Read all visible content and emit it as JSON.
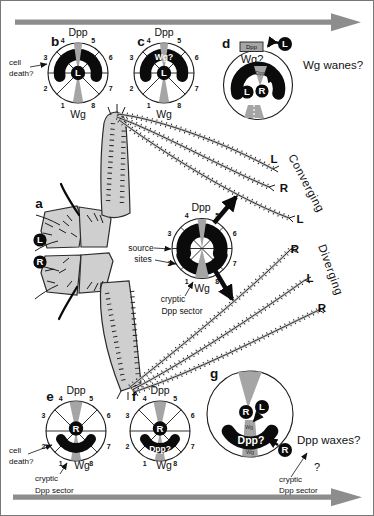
{
  "colors": {
    "big_arrow_gray": "#8d8d8d",
    "wedge_gray": "#a5a5a5",
    "source_arc_black": "#0b0b0b",
    "leg_fill_gray": "#cfcfcf",
    "background": "#ffffff"
  },
  "figure": {
    "sector_numbers": [
      "1",
      "2",
      "3",
      "4",
      "5",
      "6",
      "7",
      "8"
    ],
    "panel_a": {
      "label": "a",
      "left_badge": "L",
      "right_badge": "R"
    },
    "panel_b": {
      "label": "b",
      "dpp": "Dpp",
      "wg": "Wg",
      "center_badge": "L",
      "cell_death_line1": "cell",
      "cell_death_line2": "death?"
    },
    "panel_c": {
      "label": "c",
      "dpp": "Dpp",
      "wg": "Wg",
      "center_badge": "L",
      "wg_question": "Wg?"
    },
    "panel_d": {
      "label": "d",
      "dpp_box": "Dpp",
      "wg_question": "Wg?",
      "dpp_wedge": "Dpp",
      "left_badge": "L",
      "right_badge": "R",
      "ejected_badge": "L",
      "caption": "Wg wanes?"
    },
    "panel_e": {
      "label": "e",
      "dpp": "Dpp",
      "wg": "Wg",
      "center_badge": "R",
      "cell_death_line1": "cell",
      "cell_death_line2": "death?",
      "cryptic_line1": "cryptic",
      "cryptic_line2": "Dpp sector"
    },
    "panel_f": {
      "label": "f",
      "dpp": "Dpp",
      "wg": "Wg",
      "center_badge": "R",
      "dpp_question": "Dpp?"
    },
    "panel_g": {
      "label": "g",
      "center_badge": "R",
      "incoming_left": "L",
      "incoming_right": "R",
      "wg_upper": "Wg",
      "wg_lower": "Wg",
      "dpp_question": "Dpp?",
      "caption": "Dpp waxes?",
      "question_mark": "?",
      "cryptic_line1": "cryptic",
      "cryptic_line2": "Dpp sector"
    },
    "central": {
      "dpp": "Dpp",
      "wg": "Wg",
      "source_line1": "source",
      "source_line2": "sites",
      "cryptic_line1": "cryptic",
      "cryptic_line2": "Dpp sector"
    },
    "legs_upper": {
      "tips": [
        "L",
        "R",
        "L"
      ],
      "caption": "Converging"
    },
    "legs_lower": {
      "tips": [
        "R",
        "L",
        "R"
      ],
      "caption": "Diverging"
    }
  }
}
